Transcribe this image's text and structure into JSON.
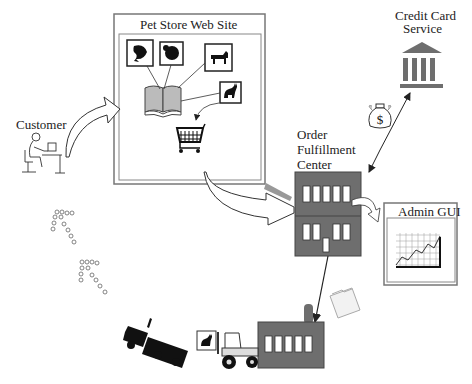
{
  "diagram": {
    "nodes": {
      "website": {
        "title": "Pet Store Web Site"
      },
      "customer": {
        "label": "Customer"
      },
      "credit": {
        "line1": "Credit Card",
        "line2": "Service"
      },
      "fulfillment": {
        "line1": "Order",
        "line2": "Fulfillment",
        "line3": "Center"
      },
      "admin": {
        "title": "Admin GUI"
      }
    },
    "icons": [
      "fish-icon",
      "bird-icon",
      "dog-icon",
      "cat-icon",
      "catalog-book-icon",
      "shopping-cart-icon",
      "customer-computer-icon",
      "bank-icon",
      "money-bag-icon",
      "office-building-icon",
      "chart-icon",
      "warehouse-icon",
      "forklift-icon",
      "truck-icon",
      "folder-icon",
      "footprints-icon"
    ],
    "colors": {
      "building": "#6e6e6e",
      "outline": "#333333",
      "panel_border": "#888888",
      "arrow_shadow": "#999999"
    }
  }
}
